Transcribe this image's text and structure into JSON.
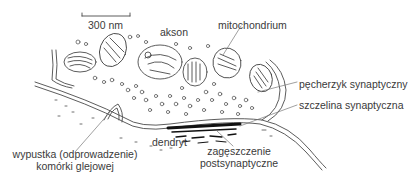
{
  "diagram": {
    "type": "synapse-cross-section",
    "scale_bar": {
      "label": "300 nm"
    },
    "labels": {
      "axon": "akson",
      "mitochondrion": "mitochondrium",
      "synaptic_vesicle": "pęcherzyk synaptyczny",
      "synaptic_cleft": "szczelina synaptyczna",
      "dendrite": "dendryt",
      "postsynaptic_density_line1": "zagęszczenie",
      "postsynaptic_density_line2": "postsynaptyczne",
      "glial_process_line1": "wypustka (odprowadzenie)",
      "glial_process_line2": "komórki glejowej"
    },
    "colors": {
      "line": "#4a4a4a",
      "text": "#3a3a3a",
      "background": "#ffffff"
    }
  }
}
